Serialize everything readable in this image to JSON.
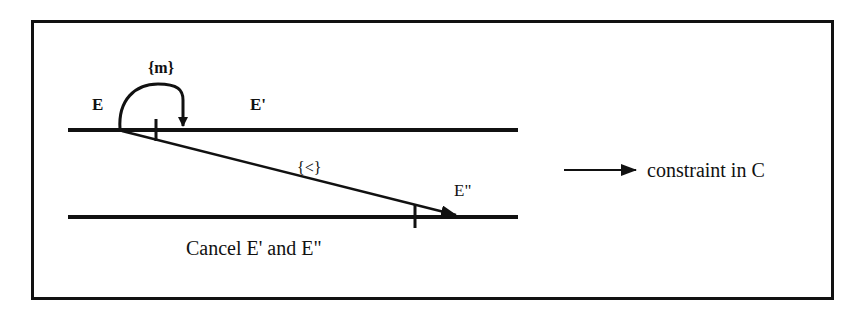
{
  "diagram": {
    "colors": {
      "ink": "#111111",
      "background": "#ffffff"
    },
    "frame": {
      "x": 31,
      "y": 20,
      "width": 803,
      "height": 280
    },
    "timelines": [
      {
        "id": "top-timeline",
        "x1": 68,
        "x2": 518,
        "y": 130
      },
      {
        "id": "bottom-timeline",
        "x1": 68,
        "x2": 518,
        "y": 217
      }
    ],
    "events": [
      {
        "id": "E",
        "label": "E"
      },
      {
        "id": "E1",
        "label": "E'"
      },
      {
        "id": "E2",
        "label": "E\""
      }
    ],
    "constraints": [
      {
        "id": "m-constraint",
        "label": "{m}",
        "from": "E",
        "to": "E'"
      },
      {
        "id": "lt-constraint",
        "label": "{<}",
        "from": "E",
        "to": "E\""
      }
    ],
    "caption": "Cancel E' and E\"",
    "legend": {
      "icon": "arrow-right-icon",
      "label": "constraint in C"
    }
  }
}
